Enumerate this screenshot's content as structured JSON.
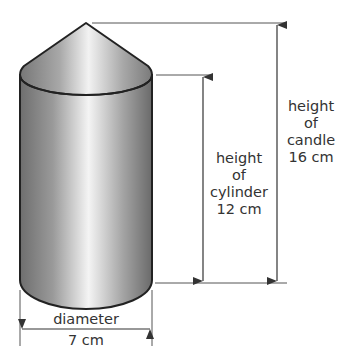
{
  "diagram": {
    "subject": "candle",
    "shape": "cylinder with cone on top",
    "labels": {
      "candle_height": {
        "line1": "height",
        "line2": "of",
        "line3": "candle",
        "line4": "16 cm"
      },
      "cylinder_height": {
        "line1": "height",
        "line2": "of",
        "line3": "cylinder",
        "line4": "12 cm"
      },
      "diameter": {
        "line1": "diameter",
        "line2": "7 cm"
      }
    },
    "measurements": {
      "candle_height_cm": 16,
      "cylinder_height_cm": 12,
      "diameter_cm": 7
    },
    "colors": {
      "outline": "#222222",
      "dimension_line": "#444444",
      "text": "#333333",
      "shade_dark": "#6e6e6e",
      "shade_light": "#f4f4f4"
    }
  }
}
